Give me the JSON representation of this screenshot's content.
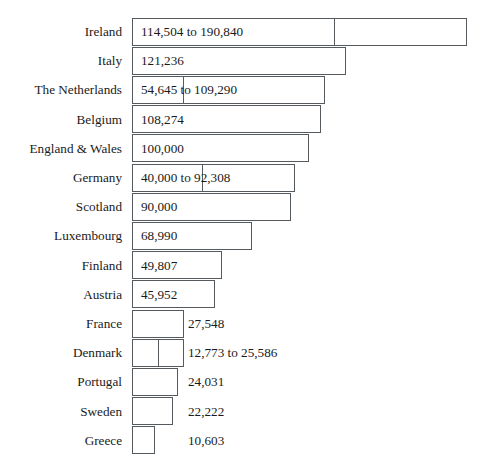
{
  "chart_data": {
    "type": "bar",
    "title": "",
    "subtitle": "",
    "xlabel": "",
    "ylabel": "",
    "orientation": "horizontal",
    "grid": false,
    "legend": null,
    "axis_visible": false,
    "xlim": [
      0,
      190840
    ],
    "categories": [
      "Ireland",
      "Italy",
      "The Netherlands",
      "Belgium",
      "England & Wales",
      "Germany",
      "Scotland",
      "Luxembourg",
      "Finland",
      "Austria",
      "France",
      "Denmark",
      "Portugal",
      "Sweden",
      "Greece"
    ],
    "values": [
      190840,
      121236,
      109290,
      108274,
      100000,
      92308,
      90000,
      68990,
      49807,
      45952,
      27548,
      25586,
      24031,
      22222,
      10603
    ],
    "value_low": [
      114504,
      null,
      54645,
      null,
      null,
      40000,
      null,
      null,
      null,
      null,
      null,
      12773,
      null,
      null,
      null
    ],
    "data_labels": [
      "114,504 to 190,840",
      "121,236",
      "54,645 to 109,290",
      "108,274",
      "100,000",
      "40,000 to 92,308",
      "90,000",
      "68,990",
      "49,807",
      "45,952",
      "27,548",
      "12,773 to 25,586",
      "24,031",
      "22,222",
      "10,603"
    ],
    "rows": [
      {
        "label": "Ireland",
        "data_label": "114,504 to 190,840",
        "value": 190840,
        "low": 114504,
        "bar_start_px": 132,
        "bar_end_px": 467,
        "divider_px": 334,
        "label_placement": "inside"
      },
      {
        "label": "Italy",
        "data_label": "121,236",
        "value": 121236,
        "low": null,
        "bar_start_px": 132,
        "bar_end_px": 346,
        "divider_px": null,
        "label_placement": "inside"
      },
      {
        "label": "The Netherlands",
        "data_label": "54,645 to 109,290",
        "value": 109290,
        "low": 54645,
        "bar_start_px": 132,
        "bar_end_px": 325,
        "divider_px": 183,
        "label_placement": "inside"
      },
      {
        "label": "Belgium",
        "data_label": "108,274",
        "value": 108274,
        "low": null,
        "bar_start_px": 132,
        "bar_end_px": 321,
        "divider_px": null,
        "label_placement": "inside"
      },
      {
        "label": "England & Wales",
        "data_label": "100,000",
        "value": 100000,
        "low": null,
        "bar_start_px": 132,
        "bar_end_px": 309,
        "divider_px": null,
        "label_placement": "inside"
      },
      {
        "label": "Germany",
        "data_label": "40,000 to 92,308",
        "value": 92308,
        "low": 40000,
        "bar_start_px": 132,
        "bar_end_px": 295,
        "divider_px": 202,
        "label_placement": "inside"
      },
      {
        "label": "Scotland",
        "data_label": "90,000",
        "value": 90000,
        "low": null,
        "bar_start_px": 132,
        "bar_end_px": 291,
        "divider_px": null,
        "label_placement": "inside"
      },
      {
        "label": "Luxembourg",
        "data_label": "68,990",
        "value": 68990,
        "low": null,
        "bar_start_px": 132,
        "bar_end_px": 252,
        "divider_px": null,
        "label_placement": "inside"
      },
      {
        "label": "Finland",
        "data_label": "49,807",
        "value": 49807,
        "low": null,
        "bar_start_px": 132,
        "bar_end_px": 222,
        "divider_px": null,
        "label_placement": "inside"
      },
      {
        "label": "Austria",
        "data_label": "45,952",
        "value": 45952,
        "low": null,
        "bar_start_px": 132,
        "bar_end_px": 215,
        "divider_px": null,
        "label_placement": "inside"
      },
      {
        "label": "France",
        "data_label": "27,548",
        "value": 27548,
        "low": null,
        "bar_start_px": 132,
        "bar_end_px": 184,
        "divider_px": null,
        "label_placement": "outside",
        "label_x_px": 188
      },
      {
        "label": "Denmark",
        "data_label": "12,773 to 25,586",
        "value": 25586,
        "low": 12773,
        "bar_start_px": 132,
        "bar_end_px": 184,
        "divider_px": 158,
        "label_placement": "outside",
        "label_x_px": 188
      },
      {
        "label": "Portugal",
        "data_label": "24,031",
        "value": 24031,
        "low": null,
        "bar_start_px": 132,
        "bar_end_px": 178,
        "divider_px": null,
        "label_placement": "outside",
        "label_x_px": 188
      },
      {
        "label": "Sweden",
        "data_label": "22,222",
        "value": 22222,
        "low": null,
        "bar_start_px": 132,
        "bar_end_px": 173,
        "divider_px": null,
        "label_placement": "outside",
        "label_x_px": 188
      },
      {
        "label": "Greece",
        "data_label": "10,603",
        "value": 10603,
        "low": null,
        "bar_start_px": 132,
        "bar_end_px": 155,
        "divider_px": null,
        "label_placement": "outside",
        "label_x_px": 188
      }
    ]
  },
  "style": {
    "bar_fill": "#ffffff",
    "bar_stroke": "#555a5e",
    "text_color": "#1a1a1a",
    "background": "#ffffff"
  },
  "layout": {
    "chart_top_px": 17,
    "row_height_px": 29.2,
    "label_column_right_px": 122
  }
}
